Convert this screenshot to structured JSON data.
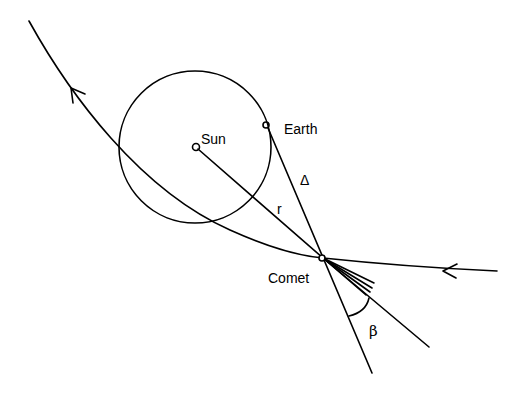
{
  "diagram": {
    "labels": {
      "sun": "Sun",
      "earth": "Earth",
      "comet": "Comet",
      "r": "r",
      "delta": "Δ",
      "beta": "β"
    },
    "elements": [
      "comet-orbit",
      "earth-orbit",
      "sun-comet-line",
      "earth-comet-line",
      "tail-direction-line",
      "comet-tail",
      "beta-angle-arc"
    ]
  }
}
